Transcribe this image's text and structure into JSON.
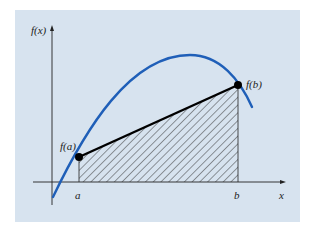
{
  "figure": {
    "type": "trapezoidal-rule-illustration",
    "labels": {
      "y_axis": "f(x)",
      "x_axis": "x",
      "point_a_value": "f(a)",
      "point_b_value": "f(b)",
      "a_tick": "a",
      "b_tick": "b"
    },
    "colors": {
      "background": "#d7e3ef",
      "curve": "#1f5fb8",
      "secant": "#000000",
      "hatch": "#2a2a2a",
      "axes": "#222222"
    }
  }
}
